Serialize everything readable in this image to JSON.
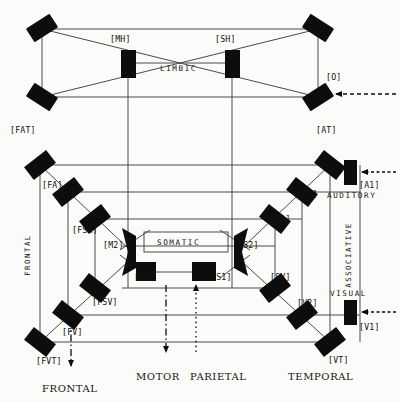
{
  "diagram": {
    "colors": {
      "node": "#0d0d0d",
      "line": "#4a4a4a",
      "text": "#111111",
      "background": "#fbfbf9"
    },
    "limbic": {
      "region_label": "LIMBIC",
      "nodes": [
        {
          "id": "MH",
          "label": "[MH]"
        },
        {
          "id": "SH",
          "label": "[SH]"
        },
        {
          "id": "O",
          "label": "[O]"
        }
      ]
    },
    "cortex": {
      "center_label": "SOMATIC",
      "nodes": [
        {
          "id": "FAT",
          "label": "[FAT]"
        },
        {
          "id": "AT",
          "label": "[AT]"
        },
        {
          "id": "FA",
          "label": "[FA]"
        },
        {
          "id": "A2",
          "label": "[A2]"
        },
        {
          "id": "A1",
          "label": "[A1]"
        },
        {
          "id": "FSA",
          "label": "[FSA]"
        },
        {
          "id": "SA",
          "label": "[SA]"
        },
        {
          "id": "M2",
          "label": "[M2]"
        },
        {
          "id": "S2",
          "label": "[S2]"
        },
        {
          "id": "M1",
          "label": "[M1]"
        },
        {
          "id": "S1",
          "label": "[S1]"
        },
        {
          "id": "SV",
          "label": "[SV]"
        },
        {
          "id": "FSV",
          "label": "[FSV]"
        },
        {
          "id": "V2",
          "label": "[V2]"
        },
        {
          "id": "V1",
          "label": "[V1]"
        },
        {
          "id": "FV",
          "label": "[FV]"
        },
        {
          "id": "FVT",
          "label": "[FVT]"
        },
        {
          "id": "VT",
          "label": "[VT]"
        }
      ]
    },
    "modality_labels": [
      {
        "id": "auditory",
        "text": "AUDITORY"
      },
      {
        "id": "visual",
        "text": "VISUAL"
      },
      {
        "id": "frontal-side",
        "text": "FRONTAL"
      },
      {
        "id": "associative",
        "text": "ASSOCIATIVE"
      }
    ],
    "lobe_labels": [
      {
        "id": "frontal",
        "text": "FRONTAL"
      },
      {
        "id": "motor",
        "text": "MOTOR"
      },
      {
        "id": "parietal",
        "text": "PARIETAL"
      },
      {
        "id": "temporal",
        "text": "TEMPORAL"
      }
    ]
  }
}
